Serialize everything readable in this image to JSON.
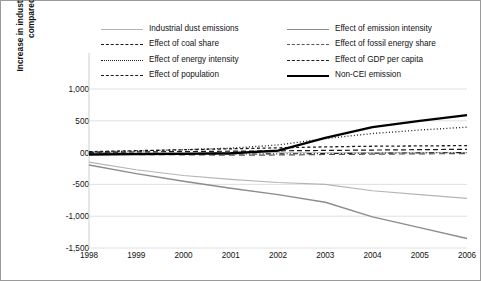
{
  "chart_data": {
    "type": "line",
    "title": "",
    "xlabel": "",
    "ylabel_line1": "Increase in industrial dust emissions",
    "ylabel_line2": "compared with 1997",
    "categories": [
      "1998",
      "1999",
      "2000",
      "2001",
      "2002",
      "2003",
      "2004",
      "2005",
      "2006"
    ],
    "x_tick_labels": [
      "1998",
      "1999",
      "2000",
      "2001",
      "2002",
      "2003",
      "2004",
      "2005",
      "2006"
    ],
    "y_tick_labels": [
      "1,000",
      "500",
      "00",
      "-500",
      "-1,000",
      "-1,500"
    ],
    "y_tick_values": [
      1000,
      500,
      0,
      -500,
      -1000,
      -1500
    ],
    "ylim": [
      -1500,
      1000
    ],
    "grid": true,
    "legend_position": "top",
    "series": [
      {
        "name": "Industrial dust emissions",
        "style": "solid",
        "color": "#b4b4b4",
        "width": 1.2,
        "values": [
          -150,
          -270,
          -360,
          -420,
          -470,
          -500,
          -600,
          -660,
          -720
        ]
      },
      {
        "name": "Effect of coal share",
        "style": "dashdotdot",
        "color": "#1a1a1a",
        "width": 1.1,
        "values": [
          -10,
          -15,
          -18,
          -22,
          -20,
          -15,
          -10,
          -5,
          0
        ]
      },
      {
        "name": "Effect of energy intensity",
        "style": "dotted",
        "color": "#1a1a1a",
        "width": 1.3,
        "values": [
          10,
          25,
          45,
          70,
          120,
          220,
          300,
          355,
          400
        ]
      },
      {
        "name": "Effect of population",
        "style": "dashed",
        "color": "#1a1a1a",
        "width": 1.2,
        "values": [
          5,
          10,
          16,
          22,
          28,
          34,
          40,
          46,
          52
        ]
      },
      {
        "name": "Effect of emission intensity",
        "style": "solid",
        "color": "#8c8c8c",
        "width": 1.4,
        "values": [
          -195,
          -330,
          -450,
          -560,
          -660,
          -780,
          -1010,
          -1180,
          -1350
        ]
      },
      {
        "name": "Effect of fossil energy share",
        "style": "longdash",
        "color": "#555555",
        "width": 1.2,
        "values": [
          -20,
          -30,
          -35,
          -40,
          -38,
          -30,
          -25,
          -20,
          -15
        ]
      },
      {
        "name": "Effect of GDP per capita",
        "style": "shortdash",
        "color": "#1a1a1a",
        "width": 1.3,
        "values": [
          15,
          30,
          45,
          60,
          75,
          90,
          100,
          105,
          110
        ]
      },
      {
        "name": "Non-CEI emission",
        "style": "thick-solid",
        "color": "#000000",
        "width": 2.3,
        "values": [
          -30,
          -25,
          -20,
          -10,
          30,
          230,
          400,
          500,
          590
        ]
      }
    ]
  },
  "legend": {
    "left_column": [
      {
        "label": "Industrial dust emissions",
        "swatch": "sw-solid-gray"
      },
      {
        "label": "Effect of coal share",
        "swatch": "sw-dashdotdot"
      },
      {
        "label": "Effect of energy intensity",
        "swatch": "sw-dotted"
      },
      {
        "label": "Effect of population",
        "swatch": "sw-dashed"
      }
    ],
    "right_column": [
      {
        "label": "Effect of emission intensity",
        "swatch": "sw-solid-dgray"
      },
      {
        "label": "Effect of fossil energy share",
        "swatch": "sw-longdash"
      },
      {
        "label": "Effect of GDP per capita",
        "swatch": "sw-shortdash"
      },
      {
        "label": "Non-CEI emission",
        "swatch": "sw-thickblack"
      }
    ]
  }
}
